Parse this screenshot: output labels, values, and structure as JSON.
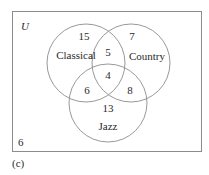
{
  "diagram": {
    "type": "venn",
    "universe_label": "U",
    "caption": "(c)",
    "sets": [
      {
        "name": "Classical"
      },
      {
        "name": "Country"
      },
      {
        "name": "Jazz"
      }
    ],
    "regions": {
      "classical_only": "15",
      "country_only": "7",
      "jazz_only": "13",
      "classical_country_only": "5",
      "classical_jazz_only": "6",
      "country_jazz_only": "8",
      "all_three": "4",
      "outside": "6"
    },
    "colors": {
      "stroke": "#8c8c8c",
      "text": "#2a2a2a",
      "background": "#ffffff"
    }
  }
}
